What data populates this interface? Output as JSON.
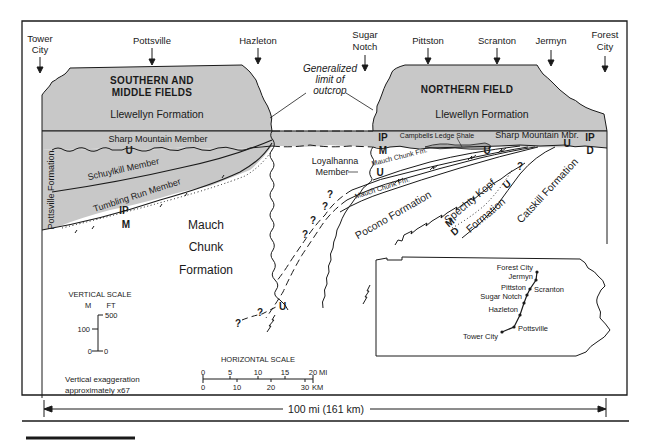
{
  "diagram": {
    "type": "geologic cross-section",
    "total_length_label": "100 mi (161 km)",
    "cities": [
      {
        "name_line1": "Tower",
        "name_line2": "City"
      },
      {
        "name_line1": "Pottsville",
        "name_line2": ""
      },
      {
        "name_line1": "Hazleton",
        "name_line2": ""
      },
      {
        "name_line1": "Sugar",
        "name_line2": "Notch"
      },
      {
        "name_line1": "Pittston",
        "name_line2": ""
      },
      {
        "name_line1": "Scranton",
        "name_line2": ""
      },
      {
        "name_line1": "Jermyn",
        "name_line2": ""
      },
      {
        "name_line1": "Forest",
        "name_line2": "City"
      }
    ],
    "fields": {
      "southern_line1": "SOUTHERN AND",
      "southern_line2": "MIDDLE FIELDS",
      "northern": "NORTHERN FIELD"
    },
    "formations": {
      "llewellyn_south": "Llewellyn Formation",
      "llewellyn_north": "Llewellyn Formation",
      "sharp_mountain_member": "Sharp Mountain Member",
      "sharp_mountain_mbr": "Sharp Mountain Mbr.",
      "schuylkill_member": "Schuylkill Member",
      "tumbling_run_member": "Tumbling Run Member",
      "pottsville_formation": "Pottsville Formation",
      "mauch_chunk_line1": "Mauch",
      "mauch_chunk_line2": "Chunk",
      "mauch_chunk_line3": "Formation",
      "campbells_ledge_shale": "Campbells Ledge Shale",
      "loyalhanna_line1": "Loyalhanna",
      "loyalhanna_line2": "Member",
      "mauch_chunk_fm_upper": "Mauch Chunk Fm.",
      "mauch_chunk_fm_lower": "Mauch Chunk Fm.",
      "pocono_formation": "Pocono  Formation",
      "spechty_kopf_line1": "Spechty Kopf",
      "spechty_kopf_line2": "Formation",
      "catskill_formation": "Catskill Formation"
    },
    "outcrop_note": {
      "line1": "Generalized",
      "line2": "limit of",
      "line3": "outcrop"
    },
    "symbols": {
      "unconformity": "U",
      "pennsylvanian": "IP",
      "mississippian": "M",
      "devonian": "D",
      "uncertain": "?"
    },
    "vertical_scale": {
      "title": "VERTICAL SCALE",
      "unit_m": "M",
      "unit_ft": "FT",
      "ft_top": "500",
      "m_mid": "100",
      "m_zero": "0",
      "ft_zero": "0"
    },
    "horizontal_scale": {
      "title": "HORIZONTAL SCALE",
      "mi_ticks": [
        "0",
        "5",
        "10",
        "15",
        "20"
      ],
      "mi_unit": "MI",
      "km_ticks": [
        "0",
        "10",
        "20",
        "30"
      ],
      "km_unit": "KM"
    },
    "exaggeration": {
      "line1": "Vertical exaggeration",
      "line2": "approximately x67"
    },
    "inset_map": {
      "name": "Pennsylvania locator map",
      "labels": [
        "Forest City",
        "Jermyn",
        "Pittston",
        "Scranton",
        "Sugar Notch",
        "Hazleton",
        "Pottsville",
        "Tower City"
      ]
    },
    "colors": {
      "shade": "#c8c8c8",
      "ink": "#1a1a1a",
      "background": "#ffffff"
    }
  }
}
